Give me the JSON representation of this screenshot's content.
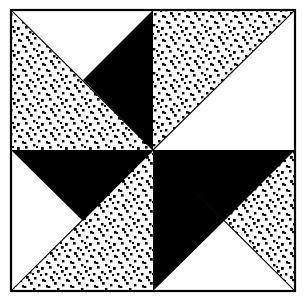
{
  "image": {
    "title": "Pinwheel Quilt Block",
    "width": 308,
    "height": 304,
    "background_color": "#ffffff",
    "ink_color": "#000000"
  },
  "frame": {
    "name": "outer-square-border",
    "x": 10,
    "y": 9,
    "width": 286,
    "height": 283,
    "stroke_color": "#000000",
    "stroke_width": 2,
    "fill": "none"
  },
  "geometry": {
    "center": {
      "x": 153,
      "y": 150
    },
    "corners": {
      "top_left": {
        "x": 11,
        "y": 10
      },
      "top_right": {
        "x": 295,
        "y": 10
      },
      "bottom_right": {
        "x": 295,
        "y": 291
      },
      "bottom_left": {
        "x": 11,
        "y": 291
      }
    },
    "edge_midpoints": {
      "top": {
        "x": 153,
        "y": 10
      },
      "right": {
        "x": 295,
        "y": 150
      },
      "bottom": {
        "x": 153,
        "y": 291
      },
      "left": {
        "x": 11,
        "y": 150
      }
    }
  },
  "texture": {
    "name": "stipple-dots",
    "dot_color": "#000000",
    "dot_size_px": 2.6,
    "tile_px": 8,
    "description": "irregular stippled dot fill"
  },
  "patches": [
    {
      "id": "patch-1",
      "name": "triangle-top-left-upper",
      "quadrant": "top-left",
      "fill": "white",
      "points": "11,10 153,10 11,150"
    },
    {
      "id": "patch-2",
      "name": "triangle-top-left-lower",
      "quadrant": "top-left",
      "fill": "dotted",
      "points": "11,10 11,150 153,150"
    },
    {
      "id": "patch-3",
      "name": "triangle-top-left-inner",
      "quadrant": "top-left",
      "fill": "white",
      "points": "11,150 153,150 153,10",
      "note": "white wedge replaced by dotted lower-left half",
      "active": false
    },
    {
      "id": "patch-4",
      "name": "triangle-top-center-black",
      "quadrant": "top-left",
      "fill": "black",
      "points": "153,10 153,150 84,80",
      "active": false
    },
    {
      "id": "patch-5",
      "name": "triangle-top-right-upper",
      "quadrant": "top-right",
      "fill": "dotted",
      "points": "153,10 295,10 153,150"
    },
    {
      "id": "patch-6",
      "name": "triangle-top-right-lower",
      "quadrant": "top-right",
      "fill": "white",
      "points": "295,10 295,150 153,150"
    },
    {
      "id": "patch-7",
      "name": "triangle-bottom-right-upper",
      "quadrant": "bottom-right",
      "fill": "dotted",
      "points": "153,150 295,150 295,291"
    },
    {
      "id": "patch-8",
      "name": "triangle-bottom-right-lower",
      "quadrant": "bottom-right",
      "fill": "white",
      "points": "153,150 295,291 153,291"
    },
    {
      "id": "patch-9",
      "name": "triangle-bottom-left-upper",
      "quadrant": "bottom-left",
      "fill": "white",
      "points": "11,150 153,150 11,291"
    },
    {
      "id": "patch-10",
      "name": "triangle-bottom-left-lower",
      "quadrant": "bottom-left",
      "fill": "dotted",
      "points": "11,291 153,150 153,291"
    }
  ],
  "black_blades": [
    {
      "id": "blade-1",
      "name": "black-blade-north",
      "points": "153,10 153,150 83,80",
      "fill": "black"
    },
    {
      "id": "blade-2",
      "name": "black-blade-east",
      "points": "295,150 153,150 224,221",
      "fill": "black"
    },
    {
      "id": "blade-3",
      "name": "black-blade-south",
      "points": "153,291 153,150 224,221",
      "fill": "black"
    },
    {
      "id": "blade-4",
      "name": "black-blade-west",
      "points": "11,150 153,150 83,221",
      "fill": "black"
    }
  ],
  "seam_lines": [
    {
      "name": "seam-diagonal-nw",
      "x1": 11,
      "y1": 10,
      "x2": 153,
      "y2": 150
    },
    {
      "name": "seam-diagonal-ne",
      "x1": 295,
      "y1": 10,
      "x2": 153,
      "y2": 150
    },
    {
      "name": "seam-diagonal-se",
      "x1": 295,
      "y1": 291,
      "x2": 153,
      "y2": 150
    },
    {
      "name": "seam-diagonal-sw",
      "x1": 11,
      "y1": 291,
      "x2": 153,
      "y2": 150
    },
    {
      "name": "seam-vertical-center",
      "x1": 153,
      "y1": 10,
      "x2": 153,
      "y2": 291
    },
    {
      "name": "seam-horizontal-center",
      "x1": 11,
      "y1": 150,
      "x2": 295,
      "y2": 150
    }
  ],
  "legend": {
    "white_label": "plain white patch",
    "black_label": "solid dark patch",
    "dotted_label": "stippled print patch"
  }
}
